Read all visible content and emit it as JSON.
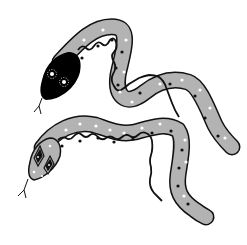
{
  "illustration": {
    "subject": "Two decorative snakes",
    "colors": {
      "background": "#ffffff",
      "body_fill": "#b3b3b3",
      "outline": "#111111",
      "head_top_snake": "#000000",
      "dots_white": "#ffffff",
      "dots_black": "#111111"
    },
    "snakes": [
      {
        "name": "upper-snake",
        "head": "black head with two white dotted eyes",
        "pattern": "wavy black line with black and white dots"
      },
      {
        "name": "lower-snake",
        "head": "grey head with diamond eye markings",
        "pattern": "wavy black line with black and white dots"
      }
    ]
  }
}
